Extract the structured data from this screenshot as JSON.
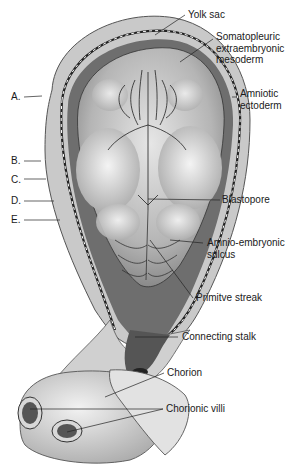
{
  "figure": {
    "left_labels": [
      {
        "id": "A",
        "text": "A."
      },
      {
        "id": "B",
        "text": "B."
      },
      {
        "id": "C",
        "text": "C."
      },
      {
        "id": "D",
        "text": "D."
      },
      {
        "id": "E",
        "text": "E."
      }
    ],
    "right_labels": {
      "yolk_sac": "Yolk sac",
      "somatopleuric": [
        "Somatopleuric",
        "extraembryonic",
        "mesoderm"
      ],
      "amniotic": [
        "Amniotic",
        "ectoderm"
      ],
      "blastopore": "Blastopore",
      "amnio_embryonic": [
        "Amnio-embryonic",
        "sulcus"
      ],
      "primitive_streak": "Primitve streak",
      "connecting_stalk": "Connecting stalk",
      "chorion": "Chorion",
      "chorionic_villi": "Chorionic villi"
    }
  }
}
